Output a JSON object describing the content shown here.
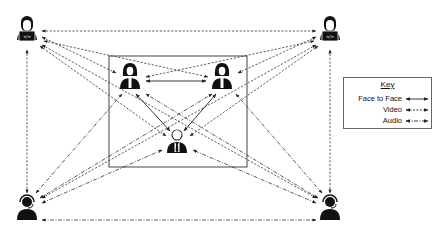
{
  "diagram": {
    "type": "communication-network",
    "colors": {
      "line": "#333333",
      "box": "#444444",
      "icon": "#111111"
    },
    "nodes": [
      {
        "id": "remote-dev-top-left",
        "kind": "developer",
        "x": 27,
        "y": 34
      },
      {
        "id": "remote-dev-top-right",
        "kind": "developer",
        "x": 330,
        "y": 34
      },
      {
        "id": "office-woman-left",
        "kind": "woman",
        "x": 130,
        "y": 79
      },
      {
        "id": "office-woman-right",
        "kind": "woman",
        "x": 222,
        "y": 79
      },
      {
        "id": "office-manager",
        "kind": "businessman",
        "x": 177,
        "y": 143
      },
      {
        "id": "support-bottom-left",
        "kind": "headset-agent",
        "x": 27,
        "y": 209
      },
      {
        "id": "support-bottom-right",
        "kind": "headset-agent",
        "x": 330,
        "y": 209
      }
    ],
    "office_box": {
      "x": 109,
      "y": 56,
      "width": 138,
      "height": 111
    }
  },
  "key": {
    "title": "Key",
    "items": [
      {
        "label": "Face to Face",
        "style": "solid"
      },
      {
        "label": "Video",
        "style": "dashed"
      },
      {
        "label": "Audio",
        "style": "dashdot"
      }
    ]
  }
}
